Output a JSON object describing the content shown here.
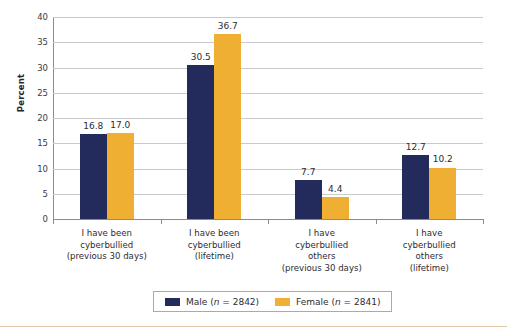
{
  "chart_data": {
    "type": "bar",
    "title": "",
    "subtitle": "",
    "xlabel": "",
    "ylabel": "Percent",
    "ylim": [
      0,
      40
    ],
    "yticks": [
      0,
      5,
      10,
      15,
      20,
      25,
      30,
      35,
      40
    ],
    "ytick_labels": [
      "0",
      "5",
      "10",
      "15",
      "20",
      "25",
      "30",
      "35",
      "40"
    ],
    "grid": true,
    "legend_position": "bottom",
    "categories": [
      "I have been cyberbullied (previous 30 days)",
      "I have been cyberbullied (lifetime)",
      "I have cyberbullied others (previous 30 days)",
      "I have cyberbullied others (lifetime)"
    ],
    "category_lines": [
      [
        "I have been",
        "cyberbullied",
        "(previous 30 days)"
      ],
      [
        "I have been",
        "cyberbullied",
        "(lifetime)"
      ],
      [
        "I have",
        "cyberbullied",
        "others",
        "(previous 30 days)"
      ],
      [
        "I have",
        "cyberbullied",
        "others",
        "(lifetime)"
      ]
    ],
    "series": [
      {
        "name": "Male (n = 2842)",
        "short_name": "Male",
        "n": "2842",
        "color": "#232a5c",
        "values": [
          16.8,
          30.5,
          7.7,
          12.7
        ],
        "labels": [
          "16.8",
          "30.5",
          "7.7",
          "12.7"
        ]
      },
      {
        "name": "Female (n = 2841)",
        "short_name": "Female",
        "n": "2841",
        "color": "#eeaf32",
        "values": [
          17.0,
          36.7,
          4.4,
          10.2
        ],
        "labels": [
          "17.0",
          "36.7",
          "4.4",
          "10.2"
        ]
      }
    ]
  },
  "legend": {
    "items": [
      {
        "label_prefix": "Male (",
        "label_italic": "n",
        "label_suffix": " = 2842)"
      },
      {
        "label_prefix": "Female (",
        "label_italic": "n",
        "label_suffix": " = 2841)"
      }
    ]
  },
  "axis": {
    "y_title": "Percent"
  }
}
